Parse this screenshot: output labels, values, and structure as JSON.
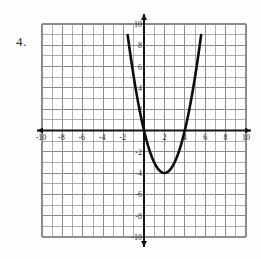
{
  "problem": {
    "number_label": "4."
  },
  "colors": {
    "background": "#fdfdfd",
    "grid_line": "#8d8d8d",
    "axis_line": "#151515",
    "curve": "#0d0d0d",
    "label_text": "#272727"
  },
  "chart_data": {
    "type": "line",
    "title": "",
    "subtitle": "",
    "xlabel": "",
    "ylabel": "",
    "xlim": [
      -10,
      10
    ],
    "ylim": [
      -10,
      10
    ],
    "grid": true,
    "grid_step": 1,
    "tick_step": 2,
    "legend": null,
    "legend_position": "none",
    "axis_arrows": [
      "left",
      "right",
      "up",
      "down"
    ],
    "xticks": [
      -10,
      -8,
      -6,
      -4,
      -2,
      2,
      4,
      6,
      8,
      10
    ],
    "xtick_labels": [
      "-10",
      "-8",
      "-6",
      "-4",
      "-2",
      "2",
      "4",
      "6",
      "8",
      "10"
    ],
    "yticks": [
      10,
      8,
      6,
      4,
      2,
      -2,
      -4,
      -6,
      -8,
      -10
    ],
    "ytick_labels": [
      "10",
      "8",
      "6",
      "4",
      "2",
      "-2",
      "-4",
      "-6",
      "-8",
      "-10"
    ],
    "series": [
      {
        "name": "parabola",
        "equation": "y = (x - 2)^2 - 4",
        "vertex": [
          2,
          -4
        ],
        "roots": [
          0,
          4
        ],
        "y_intercept": 0,
        "opens": "up",
        "color": "#0d0d0d",
        "x": [
          -1.8,
          -1.6,
          -1.4,
          -1.2,
          -1.0,
          -0.8,
          -0.6,
          -0.4,
          -0.2,
          0.0,
          0.2,
          0.4,
          0.6,
          0.8,
          1.0,
          1.2,
          1.4,
          1.6,
          1.8,
          2.0,
          2.2,
          2.4,
          2.6,
          2.8,
          3.0,
          3.2,
          3.4,
          3.6,
          3.8,
          4.0,
          4.2,
          4.4,
          4.6,
          4.8,
          5.0,
          5.2,
          5.4,
          5.6,
          5.8
        ],
        "values": [
          10.44,
          8.96,
          7.56,
          6.24,
          5.0,
          3.84,
          2.76,
          1.76,
          0.84,
          0.0,
          -0.76,
          -1.44,
          -2.04,
          -2.56,
          -3.0,
          -3.36,
          -3.64,
          -3.84,
          -3.96,
          -4.0,
          -3.96,
          -3.84,
          -3.64,
          -3.36,
          -3.0,
          -2.56,
          -2.04,
          -1.44,
          -0.76,
          0.0,
          0.84,
          1.76,
          2.76,
          3.84,
          5.0,
          6.24,
          7.56,
          8.96,
          10.44
        ]
      }
    ]
  }
}
